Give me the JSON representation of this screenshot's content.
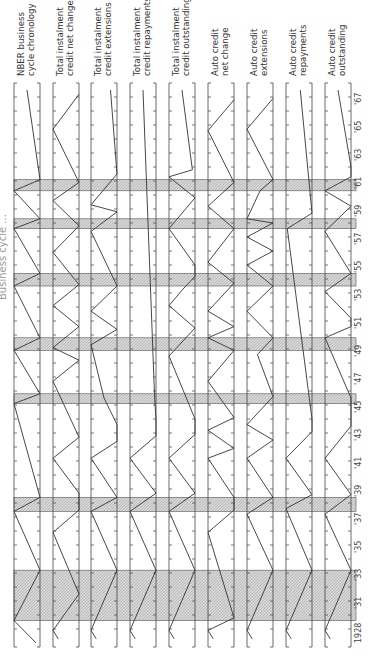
{
  "chart_data": {
    "type": "line",
    "orientation": "rotated-90 (time runs bottom to top)",
    "title_fragment": "Business cycle ... [title cut off at page edge]",
    "x_axis": {
      "label": "Year",
      "range": [
        1928,
        1967
      ],
      "tick_labels": [
        "1928",
        "'31",
        "'33",
        "'35",
        "'37",
        "'39",
        "'41",
        "'43",
        "'45",
        "'47",
        "'49",
        "'51",
        "'53",
        "'55",
        "'57",
        "'59",
        "'61",
        "'63",
        "'65",
        "'67"
      ],
      "tick_years": [
        1931,
        1933,
        1935,
        1937,
        1939,
        1941,
        1943,
        1945,
        1947,
        1949,
        1951,
        1953,
        1955,
        1957,
        1959,
        1961,
        1963,
        1965,
        1967
      ]
    },
    "recession_bands": [
      {
        "start": 1929.6,
        "end": 1933.2
      },
      {
        "start": 1937.4,
        "end": 1938.4
      },
      {
        "start": 1945.1,
        "end": 1945.8
      },
      {
        "start": 1948.9,
        "end": 1949.8
      },
      {
        "start": 1953.5,
        "end": 1954.4
      },
      {
        "start": 1957.6,
        "end": 1958.3
      },
      {
        "start": 1960.3,
        "end": 1961.1
      }
    ],
    "series_note": "Each panel shows turning points: 'P' = peak (line touches right edge), 'T' = trough (line touches left edge). Values are year of turning point; 'start'/'end' give partial-position endpoints (0=left edge,1=right edge).",
    "series": [
      {
        "name": "NBER business cycle chronology",
        "points": [
          [
            1928,
            0.85
          ],
          [
            1929.6,
            0
          ],
          [
            1933.2,
            1
          ],
          [
            1937.4,
            0
          ],
          [
            1938.4,
            1
          ],
          [
            1945.1,
            0
          ],
          [
            1945.8,
            1
          ],
          [
            1948.9,
            0
          ],
          [
            1949.8,
            1
          ],
          [
            1953.5,
            0
          ],
          [
            1954.4,
            1
          ],
          [
            1957.6,
            0
          ],
          [
            1958.3,
            1
          ],
          [
            1960.3,
            0
          ],
          [
            1961.1,
            1
          ],
          [
            1967.5,
            0.5
          ]
        ]
      },
      {
        "name": "Total instalment credit net change",
        "points": [
          [
            1928.3,
            0.2
          ],
          [
            1928.9,
            0
          ],
          [
            1931.5,
            1
          ],
          [
            1935.9,
            0
          ],
          [
            1937.5,
            1
          ],
          [
            1938.7,
            1
          ],
          [
            1941.2,
            0
          ],
          [
            1942.7,
            1
          ],
          [
            1946.7,
            0
          ],
          [
            1948.2,
            1
          ],
          [
            1949.1,
            0
          ],
          [
            1950.6,
            1
          ],
          [
            1952.1,
            0
          ],
          [
            1953.6,
            1
          ],
          [
            1955.9,
            0
          ],
          [
            1957.8,
            1
          ],
          [
            1959.6,
            0
          ],
          [
            1960.9,
            1
          ],
          [
            1964.7,
            0
          ],
          [
            1967.2,
            1
          ]
        ]
      },
      {
        "name": "Total instalment credit extensions",
        "points": [
          [
            1928.3,
            0.2
          ],
          [
            1928.9,
            0
          ],
          [
            1933.2,
            1
          ],
          [
            1937.4,
            0
          ],
          [
            1938.4,
            1
          ],
          [
            1941.2,
            0
          ],
          [
            1942.4,
            1
          ],
          [
            1943.6,
            1
          ],
          [
            1945.5,
            0.5
          ],
          [
            1949.3,
            0
          ],
          [
            1950.4,
            1
          ],
          [
            1951.7,
            0
          ],
          [
            1953.5,
            1
          ],
          [
            1957.4,
            0
          ],
          [
            1958.8,
            1
          ],
          [
            1959.3,
            0
          ],
          [
            1961.5,
            1
          ],
          [
            1967.5,
            0.75
          ]
        ]
      },
      {
        "name": "Total instalment credit repayments",
        "points": [
          [
            1928.3,
            0.2
          ],
          [
            1928.9,
            0
          ],
          [
            1933.2,
            1
          ],
          [
            1937.4,
            0
          ],
          [
            1938.7,
            1
          ],
          [
            1941.2,
            0
          ],
          [
            1942.8,
            1
          ],
          [
            1944,
            1
          ],
          [
            1945.4,
            0.95
          ],
          [
            1967.5,
            0.5
          ]
        ]
      },
      {
        "name": "Total instalment credit outstanding",
        "points": [
          [
            1928.3,
            0.2
          ],
          [
            1928.9,
            0
          ],
          [
            1933.2,
            1
          ],
          [
            1937.4,
            0
          ],
          [
            1938.7,
            1
          ],
          [
            1941.2,
            0
          ],
          [
            1942.9,
            1
          ],
          [
            1944,
            1
          ],
          [
            1948.5,
            0
          ],
          [
            1950.5,
            1
          ],
          [
            1952.1,
            0
          ],
          [
            1953.2,
            0.5
          ],
          [
            1954.2,
            1
          ],
          [
            1955,
            1
          ],
          [
            1957.6,
            0
          ],
          [
            1959.8,
            1
          ],
          [
            1961.3,
            0
          ],
          [
            1961.8,
            0.9
          ],
          [
            1967.5,
            0.5
          ]
        ]
      },
      {
        "name": "Auto credit net change",
        "points": [
          [
            1928.3,
            0.2
          ],
          [
            1928.9,
            0
          ],
          [
            1929.8,
            1
          ],
          [
            1935.9,
            0
          ],
          [
            1937.5,
            1
          ],
          [
            1938.4,
            1
          ],
          [
            1941.2,
            0
          ],
          [
            1941.9,
            1
          ],
          [
            1943.2,
            0
          ],
          [
            1944.1,
            1
          ],
          [
            1946.7,
            0
          ],
          [
            1948.9,
            1
          ],
          [
            1949.8,
            0
          ],
          [
            1950.6,
            1
          ],
          [
            1951.7,
            0
          ],
          [
            1953.7,
            1
          ],
          [
            1955.2,
            0
          ],
          [
            1957.6,
            1
          ],
          [
            1959.2,
            0
          ],
          [
            1960.9,
            1
          ],
          [
            1964.6,
            0
          ],
          [
            1966.8,
            1
          ]
        ]
      },
      {
        "name": "Auto credit extensions",
        "points": [
          [
            1928.3,
            0.2
          ],
          [
            1928.9,
            0
          ],
          [
            1933.2,
            1
          ],
          [
            1937.2,
            0
          ],
          [
            1938.4,
            1
          ],
          [
            1941.2,
            0
          ],
          [
            1942.5,
            1
          ],
          [
            1943.6,
            0
          ],
          [
            1945.6,
            1
          ],
          [
            1948.6,
            0.4
          ],
          [
            1949.8,
            1
          ],
          [
            1951.7,
            0
          ],
          [
            1953.5,
            1
          ],
          [
            1955,
            0
          ],
          [
            1956,
            1
          ],
          [
            1957,
            0
          ],
          [
            1958,
            1
          ],
          [
            1958.3,
            0
          ],
          [
            1960.3,
            0.5
          ],
          [
            1961.1,
            1
          ],
          [
            1964.7,
            0
          ],
          [
            1966.9,
            1
          ]
        ]
      },
      {
        "name": "Auto credit repayments",
        "points": [
          [
            1928.3,
            0.2
          ],
          [
            1928.9,
            0
          ],
          [
            1933.2,
            1
          ],
          [
            1937.6,
            0
          ],
          [
            1938.6,
            1
          ],
          [
            1941.2,
            0
          ],
          [
            1943.1,
            1
          ],
          [
            1944,
            1
          ],
          [
            1957.6,
            0.05
          ],
          [
            1958.7,
            1
          ],
          [
            1967.5,
            0.55
          ]
        ]
      },
      {
        "name": "Auto credit outstanding",
        "points": [
          [
            1928.3,
            0.2
          ],
          [
            1928.9,
            0
          ],
          [
            1933.2,
            1
          ],
          [
            1937.2,
            0
          ],
          [
            1938.6,
            1
          ],
          [
            1941.2,
            0
          ],
          [
            1943.5,
            1
          ],
          [
            1944.5,
            1
          ],
          [
            1945.5,
            1
          ],
          [
            1949.8,
            0
          ],
          [
            1950.6,
            1
          ],
          [
            1951.2,
            1
          ],
          [
            1953.1,
            0
          ],
          [
            1954.4,
            1
          ],
          [
            1957.4,
            0
          ],
          [
            1959.2,
            1
          ],
          [
            1960.3,
            0
          ],
          [
            1961.3,
            1
          ],
          [
            1962,
            1
          ],
          [
            1967.5,
            0.5
          ]
        ]
      }
    ],
    "legend": [],
    "grid": false
  },
  "panels": [
    {
      "line1": "NBER business",
      "line2": "cycle chronology"
    },
    {
      "line1": "Total instalment",
      "line2": "credit net change"
    },
    {
      "line1": "Total instalment",
      "line2": "credit extensions"
    },
    {
      "line1": "Total instalment",
      "line2": "credit repayments"
    },
    {
      "line1": "Total instalment",
      "line2": "credit outstanding"
    },
    {
      "line1": "Auto credit",
      "line2": "net change"
    },
    {
      "line1": "Auto credit",
      "line2": "extensions"
    },
    {
      "line1": "Auto credit",
      "line2": "repayments"
    },
    {
      "line1": "Auto credit",
      "line2": "outstanding"
    }
  ],
  "colors": {
    "line": "#333333",
    "band": "#d0d0d0",
    "band_edge": "#555555",
    "frame": "#444444"
  }
}
